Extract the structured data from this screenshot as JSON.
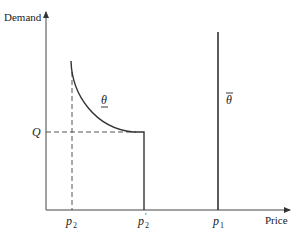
{
  "diagram": {
    "type": "economics-demand-diagram",
    "y_axis_label": "Demand",
    "x_axis_label": "Price",
    "q_label": "Q",
    "x_ticks": [
      {
        "id": "p2",
        "base": "p",
        "sub": "2",
        "prime": ""
      },
      {
        "id": "p2prime",
        "base": "p",
        "sub": "2",
        "prime": "′"
      },
      {
        "id": "p1",
        "base": "p",
        "sub": "1",
        "prime": ""
      }
    ],
    "curves": [
      {
        "id": "theta-low",
        "label": "θ",
        "decoration": "underline",
        "description": "Decreasing convex demand curve from p2 down to Q, flat to p2', then vertical drop to axis"
      },
      {
        "id": "theta-high",
        "label": "θ",
        "decoration": "overline",
        "description": "Vertical demand line at p1"
      }
    ],
    "colors": {
      "line": "#333333",
      "dashed": "#555555",
      "text": "#222222"
    }
  }
}
